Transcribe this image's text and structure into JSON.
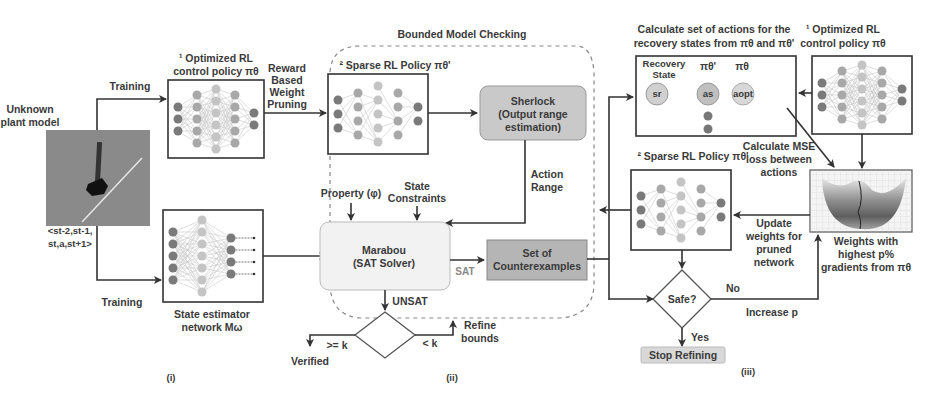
{
  "diagram": {
    "sections": {
      "i": "(i)",
      "ii": "(ii)",
      "iii": "(iii)"
    },
    "section_i": {
      "plant_label": [
        "Unknown",
        "plant model"
      ],
      "training_top": "Training",
      "training_bottom": "Training",
      "tuple_label": [
        "<st-2,st-1,",
        "st,a,st+1>"
      ],
      "optimized_policy_title": [
        "¹ Optimized RL",
        "control policy πθ"
      ],
      "reward_pruning": [
        "Reward",
        "Based",
        "Weight",
        "Pruning"
      ],
      "state_estimator_title": [
        "State estimator",
        "network Mω"
      ]
    },
    "section_ii": {
      "title": "Bounded Model Checking",
      "sparse_policy_title": "² Sparse RL Policy πθ'",
      "sherlock": [
        "Sherlock",
        "(Output range",
        "estimation)"
      ],
      "action_range": [
        "Action",
        "Range"
      ],
      "property": "Property (φ)",
      "state_constraints": [
        "State",
        "Constraints"
      ],
      "marabou": [
        "Marabou",
        "(SAT Solver)"
      ],
      "sat": "SAT",
      "unsat": "UNSAT",
      "counterexamples": [
        "Set of",
        "Counterexamples"
      ],
      "geq_k": ">= k",
      "lt_k": "< k",
      "verified": "Verified",
      "refine_bounds": [
        "Refine",
        "bounds"
      ]
    },
    "section_iii": {
      "calc_actions_title": [
        "Calculate set of actions for the",
        "recovery states from πθ and πθ'"
      ],
      "recovery_state": [
        "Recovery",
        "State"
      ],
      "pi_theta_prime": "πθ'",
      "pi_theta": "πθ",
      "node_sr": "sr",
      "node_as": "as",
      "node_aopt": "aopt",
      "optimized_policy_title": [
        "¹ Optimized RL",
        "control policy πθ"
      ],
      "mse_label": [
        "Calculate MSE",
        "loss between",
        "actions"
      ],
      "sparse_policy_title": "² Sparse RL Policy πθ'",
      "update_weights": [
        "Update",
        "weights for",
        "pruned",
        "network"
      ],
      "weights_grad": [
        "Weights with",
        "highest p%",
        "gradients from πθ"
      ],
      "safe": "Safe?",
      "no": "No",
      "yes": "Yes",
      "increase_p": "Increase p",
      "stop_refining": "Stop Refining"
    },
    "colors": {
      "node_dark": "#7a7a7a",
      "node_mid": "#a8a8a8",
      "node_light": "#c4c4c4",
      "sherlock_fill": "#c9c9c9",
      "marabou_fill": "#f2f2f2",
      "counterexamples_fill": "#b5b5b5",
      "stop_fill": "#d8d8d8",
      "plant_bg": "#8a8a8a"
    }
  }
}
